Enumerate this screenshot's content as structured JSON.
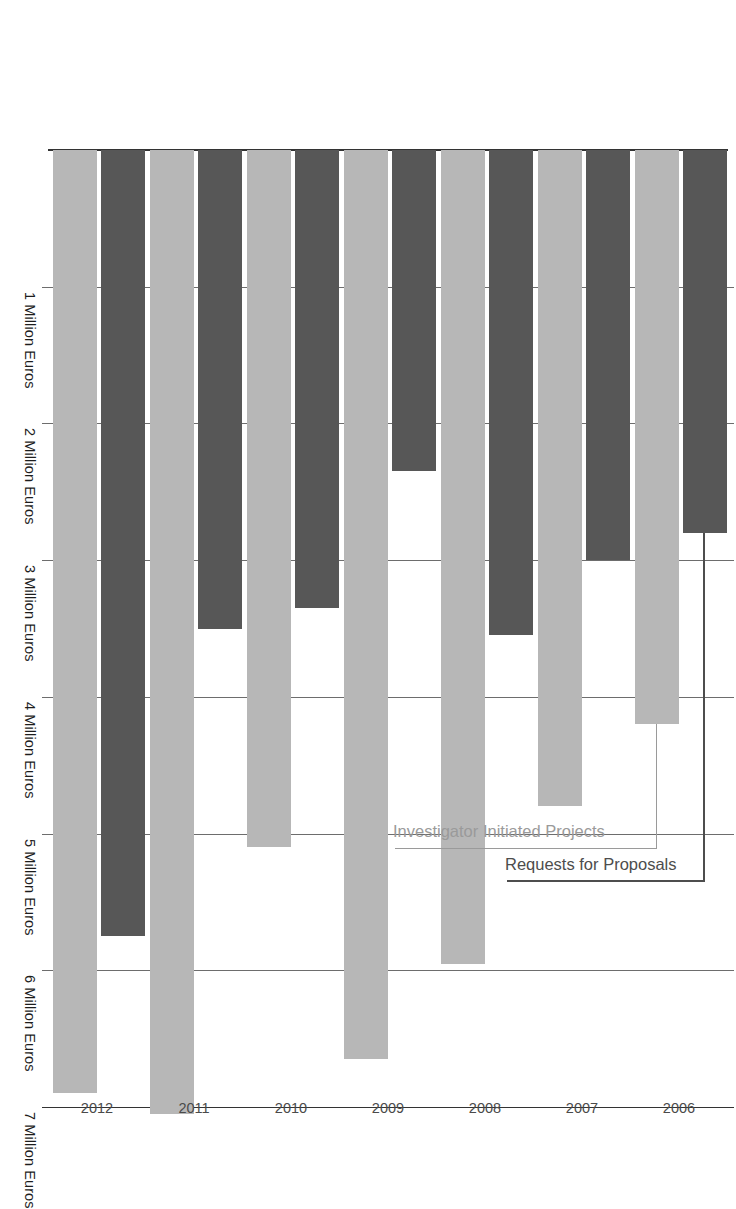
{
  "chart_data": {
    "type": "bar",
    "orientation": "horizontal",
    "title": "",
    "subtitle": "",
    "xlabel": "",
    "ylabel": "",
    "categories": [
      "2006",
      "2007",
      "2008",
      "2009",
      "2010",
      "2011",
      "2012"
    ],
    "tick_labels": [
      "1 Million Euros",
      "2 Million Euros",
      "3 Million Euros",
      "4 Million Euros",
      "5 Million Euros",
      "6 Million Euros",
      "7 Million Euros"
    ],
    "tick_values": [
      1,
      2,
      3,
      4,
      5,
      6,
      7
    ],
    "xlim": [
      0,
      7.05
    ],
    "grid": true,
    "legend_position": "inside-left",
    "series": [
      {
        "name": "Investigator Initiated Projects",
        "color": "#b7b7b7",
        "values": [
          4.2,
          4.8,
          5.95,
          6.65,
          5.1,
          7.05,
          6.9
        ]
      },
      {
        "name": "Requests for Proposals",
        "color": "#575757",
        "values": [
          2.8,
          3.0,
          3.55,
          2.35,
          3.35,
          3.5,
          5.75
        ]
      }
    ],
    "annotations": [
      {
        "label": "Investigator Initiated Projects",
        "series": "Investigator Initiated Projects",
        "color": "#9a9a9a"
      },
      {
        "label": "Requests for Proposals",
        "series": "Requests for Proposals",
        "color": "#4d4d4d"
      }
    ]
  },
  "colors": {
    "series_light": "#b7b7b7",
    "series_dark": "#575757",
    "gridline": "#6d6d6d",
    "axis": "#333333",
    "tick_text": "#1d1d1d",
    "category_text": "#4a4a4a",
    "leader_light": "#9a9a9a",
    "leader_dark": "#4d4d4d",
    "background": "#ffffff"
  }
}
